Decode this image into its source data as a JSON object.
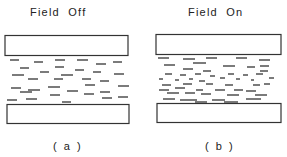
{
  "diagram": {
    "panels": [
      {
        "id": "a",
        "title": "Field  Off",
        "label": "( a )",
        "state": "molecules aligned parallel to plates"
      },
      {
        "id": "b",
        "title": "Field  On",
        "label": "( b )",
        "state": "molecules reoriented (short segments in middle)"
      }
    ],
    "colors": {
      "line": "#333333",
      "background": "#ffffff"
    }
  }
}
